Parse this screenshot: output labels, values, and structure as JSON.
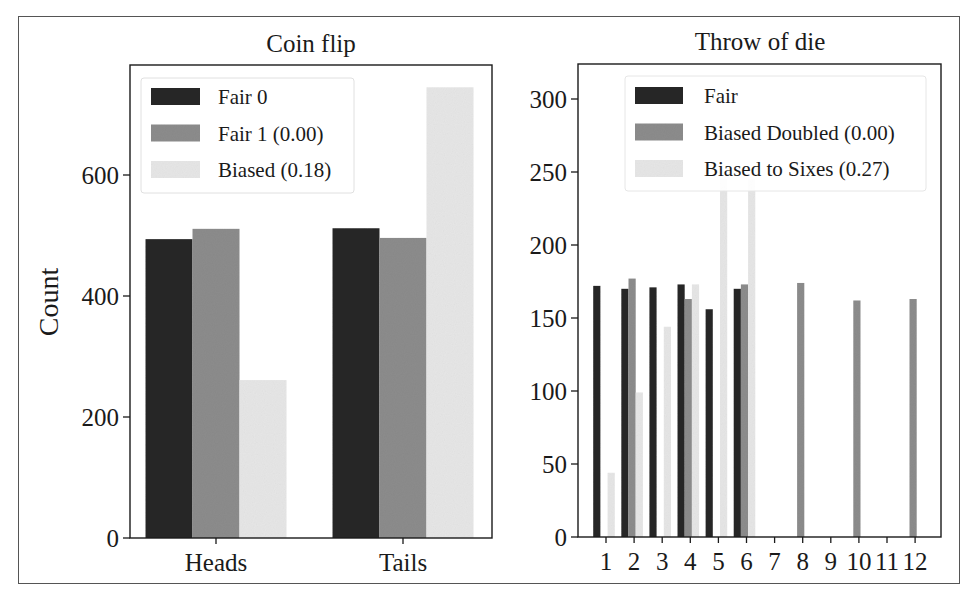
{
  "figure": {
    "ylabel": "Count"
  },
  "colors": {
    "dark": "#262626",
    "mid": "#8c8c8c",
    "light": "#e6e6e6",
    "axis": "#1a1a1a"
  },
  "chart_data": [
    {
      "type": "bar",
      "title": "Coin flip",
      "xlabel": "",
      "ylabel": "Count",
      "categories": [
        "Heads",
        "Tails"
      ],
      "series": [
        {
          "name": "Fair 0",
          "color_key": "dark",
          "values": [
            494,
            512
          ]
        },
        {
          "name": "Fair 1 (0.00)",
          "color_key": "mid",
          "values": [
            511,
            496
          ]
        },
        {
          "name": "Biased (0.18)",
          "color_key": "light",
          "values": [
            261,
            745
          ]
        }
      ],
      "yticks": [
        0,
        200,
        400,
        600
      ],
      "ylim": [
        0,
        780
      ],
      "grid": false,
      "legend_position": "upper left"
    },
    {
      "type": "bar",
      "title": "Throw of die",
      "xlabel": "",
      "ylabel": "",
      "categories": [
        "1",
        "2",
        "3",
        "4",
        "5",
        "6",
        "7",
        "8",
        "9",
        "10",
        "11",
        "12"
      ],
      "series": [
        {
          "name": "Fair",
          "color_key": "dark",
          "values": [
            172,
            170,
            171,
            173,
            156,
            170,
            0,
            0,
            0,
            0,
            0,
            0
          ]
        },
        {
          "name": "Biased Doubled (0.00)",
          "color_key": "mid",
          "values": [
            0,
            177,
            0,
            163,
            0,
            173,
            0,
            174,
            0,
            162,
            0,
            163
          ]
        },
        {
          "name": "Biased to Sixes (0.27)",
          "color_key": "light",
          "values": [
            44,
            99,
            144,
            173,
            245,
            245,
            0,
            0,
            0,
            0,
            0,
            0
          ]
        }
      ],
      "yticks": [
        0,
        50,
        100,
        150,
        200,
        250,
        300
      ],
      "ylim": [
        0,
        323
      ],
      "grid": false,
      "legend_position": "upper right"
    }
  ]
}
